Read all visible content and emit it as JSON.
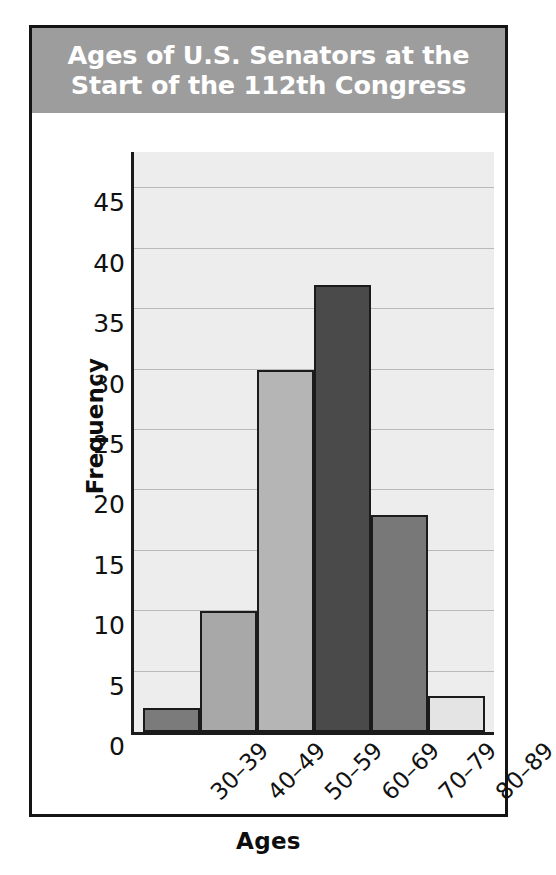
{
  "figure": {
    "title": "Ages of U.S. Senators at the\nStart of the 112th Congress",
    "title_banner_color": "#9d9d9d",
    "title_text_color": "#ffffff",
    "frame_color": "#141414",
    "plot_background_color": "#ededed",
    "gridline_color": "#b9b9b9",
    "axis_color": "#1b1b1b"
  },
  "chart_data": {
    "type": "bar",
    "title": "Ages of U.S. Senators at the Start of the 112th Congress",
    "xlabel": "Ages",
    "ylabel": "Frequency",
    "categories": [
      "30–39",
      "40–49",
      "50–59",
      "60–69",
      "70–79",
      "80–89"
    ],
    "values": [
      2,
      10,
      30,
      37,
      18,
      3
    ],
    "bar_colors": [
      "#7b7b7b",
      "#a8a8a8",
      "#b5b5b5",
      "#4a4a4a",
      "#787878",
      "#e4e4e4"
    ],
    "ylim": [
      0,
      48
    ],
    "yticks": [
      0,
      5,
      10,
      15,
      20,
      25,
      30,
      35,
      40,
      45
    ],
    "ytick_labels": [
      "0",
      "5",
      "10",
      "15",
      "20",
      "25",
      "30",
      "35",
      "40",
      "45"
    ],
    "grid": true,
    "grid_axis": "y",
    "legend": false,
    "bar_gap": 0,
    "xtick_rotation": -45
  }
}
